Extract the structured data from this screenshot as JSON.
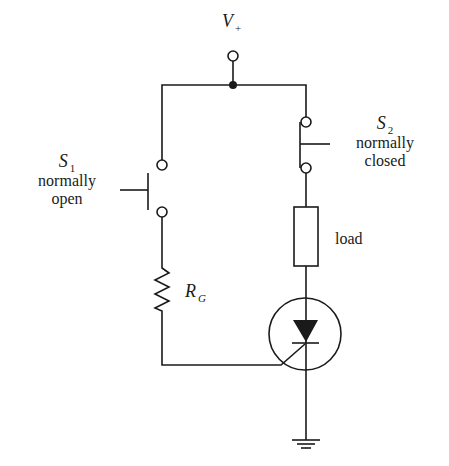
{
  "diagram": {
    "colors": {
      "line": "#1a1a1a",
      "background": "#ffffff"
    },
    "labels": {
      "supply": {
        "symbol": "V",
        "subscript": "+"
      },
      "s1": {
        "symbol": "S",
        "subscript": "1",
        "line1": "normally",
        "line2": "open"
      },
      "s2": {
        "symbol": "S",
        "subscript": "2",
        "line1": "normally",
        "line2": "closed"
      },
      "load": "load",
      "gate_resistor": {
        "symbol": "R",
        "subscript": "G"
      }
    },
    "components": [
      {
        "id": "supply-terminal",
        "type": "terminal",
        "label": "V+"
      },
      {
        "id": "s1",
        "type": "push-button switch",
        "state": "normally open"
      },
      {
        "id": "s2",
        "type": "push-button switch",
        "state": "normally closed"
      },
      {
        "id": "load",
        "type": "load (resistor box)"
      },
      {
        "id": "rg",
        "type": "resistor",
        "label": "RG"
      },
      {
        "id": "scr",
        "type": "thyristor (SCR)"
      },
      {
        "id": "ground",
        "type": "ground"
      }
    ]
  }
}
